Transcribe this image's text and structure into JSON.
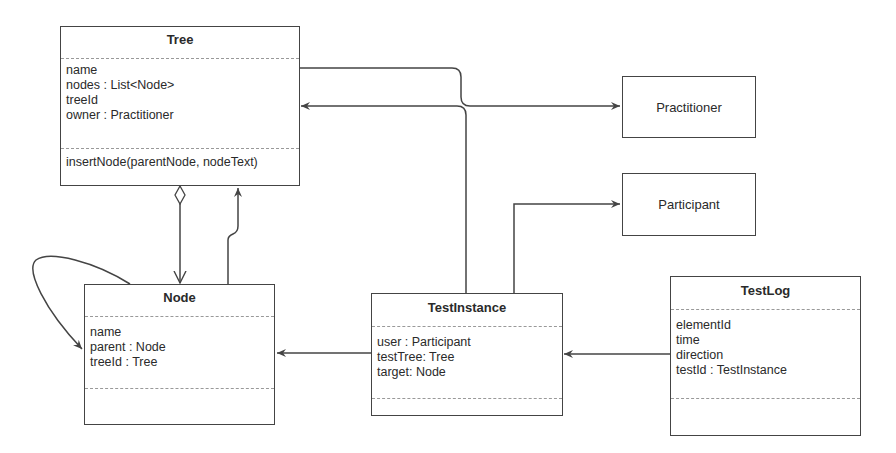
{
  "diagram": {
    "type": "UML class diagram",
    "classes": [
      {
        "name": "Tree",
        "attributes": [
          "name",
          "nodes : List<Node>",
          "treeId",
          "owner : Practitioner"
        ],
        "methods": [
          "insertNode(parentNode, nodeText)"
        ]
      },
      {
        "name": "Node",
        "attributes": [
          "name",
          "parent : Node",
          "treeId : Tree"
        ],
        "methods": []
      },
      {
        "name": "TestInstance",
        "attributes": [
          "user : Participant",
          "testTree: Tree",
          "target: Node"
        ],
        "methods": []
      },
      {
        "name": "TestLog",
        "attributes": [
          "elementId",
          "time",
          "direction",
          "testId : TestInstance"
        ],
        "methods": []
      }
    ],
    "simple_classes": [
      {
        "name": "Practitioner"
      },
      {
        "name": "Participant"
      }
    ],
    "relationships": [
      {
        "from": "Tree",
        "to": "Practitioner",
        "kind": "association-arrow"
      },
      {
        "from": "TestInstance",
        "to": "Tree",
        "kind": "association-arrow"
      },
      {
        "from": "TestInstance",
        "to": "Participant",
        "kind": "association-arrow"
      },
      {
        "from": "TestInstance",
        "to": "Node",
        "kind": "association-arrow"
      },
      {
        "from": "TestLog",
        "to": "TestInstance",
        "kind": "association-arrow"
      },
      {
        "from": "Tree",
        "to": "Node",
        "kind": "aggregation"
      },
      {
        "from": "Node",
        "to": "Tree",
        "kind": "association-arrow"
      },
      {
        "from": "Node",
        "to": "Node",
        "kind": "self-association"
      }
    ],
    "colors": {
      "line": "#444444",
      "divider": "#999999",
      "background": "#ffffff"
    }
  }
}
